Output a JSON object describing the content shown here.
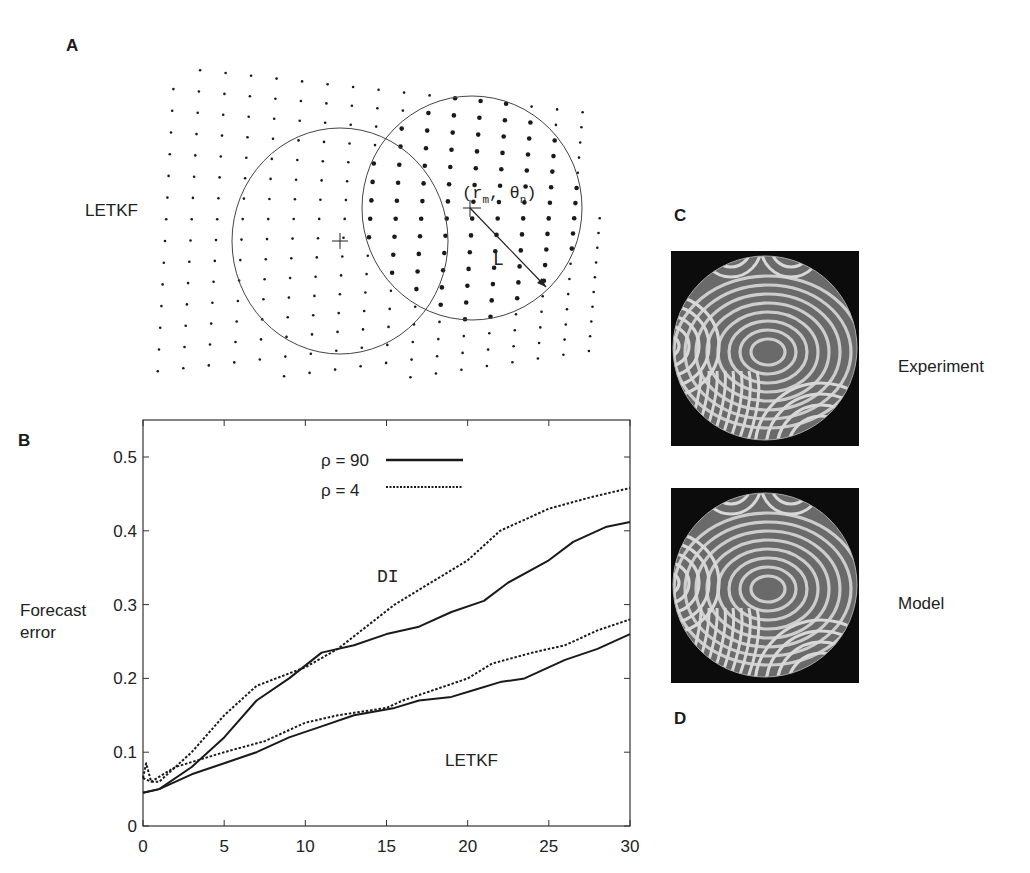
{
  "figure": {
    "panels": {
      "A": {
        "label": "A",
        "side_label": "LETKF",
        "coord_label": "(r",
        "coord_sub_m": "m",
        "coord_mid": ", θ",
        "coord_sub_n": "n",
        "coord_end": ")",
        "radius_label": "L"
      },
      "B": {
        "label": "B",
        "ylabel_line1": "Forecast",
        "ylabel_line2": "error",
        "legend": [
          {
            "label": "ρ = 90",
            "style": "solid"
          },
          {
            "label": "ρ = 4",
            "style": "dotted"
          }
        ],
        "annotations": {
          "upper": "DI",
          "lower": "LETKF"
        }
      },
      "C": {
        "label": "C",
        "top_caption": "Experiment",
        "bottom_caption": "Model"
      },
      "D": {
        "label": "D"
      }
    }
  },
  "chart_data": {
    "type": "line",
    "title": "",
    "xlabel": "",
    "ylabel": "Forecast error",
    "xlim": [
      0,
      30
    ],
    "ylim": [
      0,
      0.55
    ],
    "xticks": [
      0,
      5,
      10,
      15,
      20,
      25,
      30
    ],
    "yticks": [
      0,
      0.1,
      0.2,
      0.3,
      0.4,
      0.5
    ],
    "ytick_labels": [
      "0",
      "0.1",
      "0.2",
      "0.3",
      "0.4",
      "0.5"
    ],
    "xtick_labels": [
      "0",
      "5",
      "10",
      "15",
      "20",
      "25",
      "30"
    ],
    "grid": false,
    "legend_position": "upper center",
    "series": [
      {
        "name": "DI, ρ = 90",
        "style": "solid",
        "x": [
          0,
          1,
          3,
          5,
          7,
          9,
          11,
          13,
          15,
          17,
          19,
          21,
          22.5,
          25,
          26.5,
          28.5,
          30
        ],
        "y": [
          0.045,
          0.05,
          0.08,
          0.12,
          0.17,
          0.2,
          0.235,
          0.245,
          0.26,
          0.27,
          0.29,
          0.305,
          0.33,
          0.36,
          0.385,
          0.405,
          0.412
        ]
      },
      {
        "name": "DI, ρ = 4",
        "style": "dotted",
        "x": [
          0,
          0.2,
          0.5,
          1,
          3,
          5,
          7,
          10,
          12,
          15.5,
          20,
          22,
          25,
          27.5,
          30
        ],
        "y": [
          0.065,
          0.085,
          0.06,
          0.06,
          0.1,
          0.15,
          0.19,
          0.215,
          0.24,
          0.3,
          0.36,
          0.4,
          0.43,
          0.445,
          0.458
        ]
      },
      {
        "name": "LETKF, ρ = 90",
        "style": "solid",
        "x": [
          0,
          1,
          3,
          5,
          7,
          9,
          11,
          13,
          15.5,
          17,
          19,
          20.5,
          22,
          23.5,
          26,
          28,
          30
        ],
        "y": [
          0.045,
          0.05,
          0.07,
          0.085,
          0.1,
          0.12,
          0.135,
          0.15,
          0.16,
          0.17,
          0.175,
          0.185,
          0.195,
          0.2,
          0.225,
          0.24,
          0.26
        ]
      },
      {
        "name": "LETKF, ρ = 4",
        "style": "dotted",
        "x": [
          0,
          0.5,
          2,
          5,
          7.5,
          10,
          12,
          15,
          16,
          18,
          20,
          21.5,
          24,
          26,
          28,
          30
        ],
        "y": [
          0.065,
          0.06,
          0.08,
          0.1,
          0.115,
          0.14,
          0.15,
          0.16,
          0.17,
          0.185,
          0.2,
          0.22,
          0.235,
          0.245,
          0.265,
          0.28
        ]
      }
    ]
  }
}
